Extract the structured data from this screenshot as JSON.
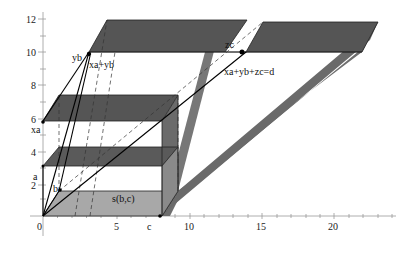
{
  "diagram": {
    "title": "",
    "colors": {
      "dark_slab": "#555555",
      "light_slab": "#a9a9a9",
      "band": "#707070",
      "axis": "#888888",
      "line": "#000000",
      "dashed": "#333333"
    },
    "x_axis": {
      "ticks": [
        "0",
        "5",
        "10",
        "15",
        "20"
      ],
      "point_label": "c"
    },
    "y_axis": {
      "ticks": [
        "2",
        "4",
        "6",
        "8",
        "10",
        "12"
      ],
      "point_labels": [
        "a",
        "xa"
      ]
    },
    "labels": {
      "yb": "yb",
      "xa_plus_yb": "xa+yb",
      "zc": "zc",
      "equation": "xa+yb+zc=d",
      "b": "b",
      "a": "a",
      "xa": "xa",
      "c": "c",
      "s_bc": "s(b,c)"
    }
  }
}
